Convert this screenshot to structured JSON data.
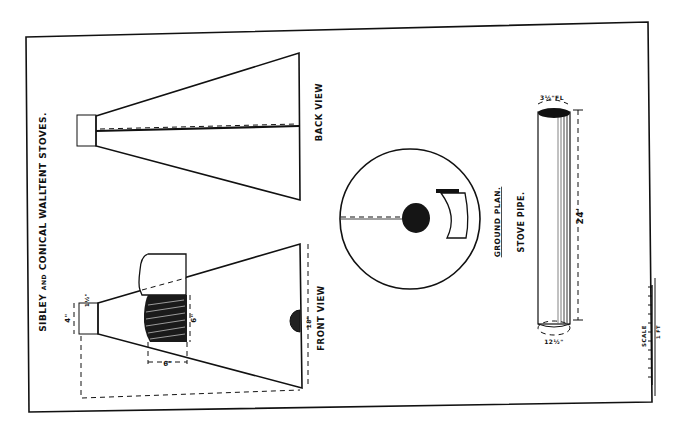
{
  "plate": {
    "title": "SIBLEY AND CONICAL WALL TENT STOVES.",
    "title_parts": {
      "prefix": "SIBLEY",
      "conj": "AND",
      "rest": "CONICAL WALLTENT STOVES."
    },
    "colors": {
      "ink": "#111111",
      "paper": "#ffffff"
    }
  },
  "views": {
    "back_view": {
      "label": "BACK VIEW"
    },
    "front_view": {
      "label": "FRONT VIEW",
      "dimensions": {
        "collar_width": "4\"",
        "collar_depth": "1½\"",
        "door_height": "6\"",
        "door_width": "6\"",
        "damper": "18\""
      }
    },
    "ground_plan": {
      "label": "GROUND PLAN."
    },
    "stove_pipe": {
      "label": "STOVE PIPE.",
      "length": "24'",
      "top_dim": "3½\"FL",
      "bottom_dim": "12½\""
    }
  },
  "scale": {
    "label": "SCALE",
    "ticks": [
      "2",
      "3",
      "4",
      "5",
      "6",
      "7",
      "8",
      "9",
      "10",
      "11",
      "12"
    ],
    "unit": "1 FT"
  }
}
